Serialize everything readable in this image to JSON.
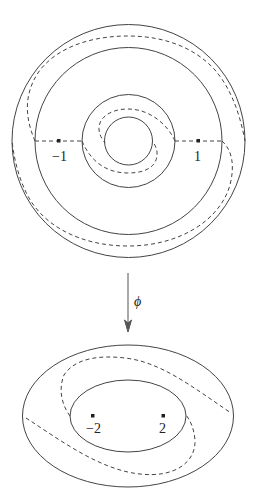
{
  "top_figure": {
    "description": "Annulus with punctures at -1 and 1 and dashed arcs",
    "puncture_labels": [
      "−1",
      "1"
    ]
  },
  "map": {
    "label": "ϕ"
  },
  "bottom_figure": {
    "description": "Elliptical annulus with punctures at -2 and 2 and dashed arcs",
    "puncture_labels": [
      "−2",
      "2"
    ]
  },
  "colors": {
    "stroke": "#444444",
    "background": "#ffffff"
  }
}
